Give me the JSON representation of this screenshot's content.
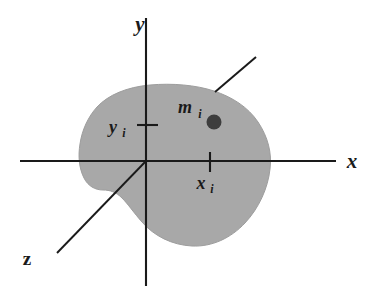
{
  "figure": {
    "name": "rigid-body-coordinate-diagram",
    "background_color": "#ffffff",
    "body": {
      "fill_color": "#a8a8a8",
      "edge_color": "#9a9a9a"
    },
    "axes": {
      "line_color": "#1a1a1a",
      "line_width": 2,
      "origin": {
        "x": 146,
        "y": 161
      },
      "x_axis": {
        "label": "x",
        "label_x": 352,
        "label_y": 168,
        "from_x": 20,
        "to_x": 336,
        "y": 161
      },
      "y_axis": {
        "label": "y",
        "label_x": 140,
        "label_y": 31,
        "from_y": 18,
        "to_y": 286,
        "x": 146
      },
      "z_axis": {
        "label": "z",
        "label_x": 27,
        "label_y": 265,
        "to_x": 57,
        "to_y": 253
      }
    },
    "ticks": [
      {
        "name": "x-tick",
        "label": "x",
        "subscript": "i",
        "axis": "x",
        "position_x": 210,
        "position_y": 161,
        "label_x": 201,
        "label_y": 189,
        "sub_x": 212,
        "sub_y": 193,
        "orientation": "vertical"
      },
      {
        "name": "y-tick",
        "label": "y",
        "subscript": "i",
        "axis": "y",
        "position_x": 146,
        "position_y": 125,
        "label_x": 113,
        "label_y": 133,
        "sub_x": 124,
        "sub_y": 137,
        "orientation": "horizontal"
      }
    ],
    "point_mass": {
      "name": "m-i",
      "label": "m",
      "subscript": "i",
      "label_x": 185,
      "label_y": 113,
      "sub_x": 200,
      "sub_y": 118,
      "dot_x": 214,
      "dot_y": 122,
      "dot_radius": 7,
      "dot_color": "#3d3d3d"
    },
    "leader_line": {
      "name": "body-leader-line",
      "from_x": 215,
      "from_y": 92,
      "to_x": 256,
      "to_y": 57,
      "color": "#1a1a1a",
      "width": 2
    }
  }
}
